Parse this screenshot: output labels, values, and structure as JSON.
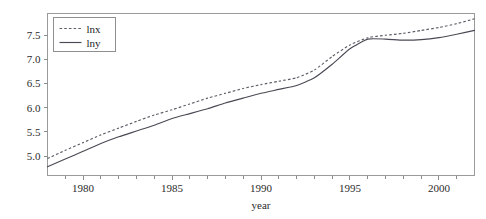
{
  "chart_data": {
    "type": "line",
    "title": "",
    "subtitle": "",
    "xlabel": "year",
    "ylabel": "",
    "xlim": [
      1978,
      2002
    ],
    "ylim": [
      4.6,
      7.95
    ],
    "grid": false,
    "legend_position": "top-left",
    "x_ticks_major": [
      "1980",
      "1985",
      "1990",
      "1995",
      "2000"
    ],
    "x_ticks_major_values": [
      1980,
      1985,
      1990,
      1995,
      2000
    ],
    "x_ticks_minor_values": [
      1979,
      1981,
      1982,
      1983,
      1984,
      1986,
      1987,
      1988,
      1989,
      1991,
      1992,
      1993,
      1994,
      1996,
      1997,
      1998,
      1999,
      2001
    ],
    "y_ticks": [
      "5.0",
      "5.5",
      "6.0",
      "6.5",
      "7.0",
      "7.5"
    ],
    "y_ticks_values": [
      5.0,
      5.5,
      6.0,
      6.5,
      7.0,
      7.5
    ],
    "x": [
      1978,
      1979,
      1980,
      1981,
      1982,
      1983,
      1984,
      1985,
      1986,
      1987,
      1988,
      1989,
      1990,
      1991,
      1992,
      1993,
      1994,
      1995,
      1996,
      1997,
      1998,
      1999,
      2000,
      2001,
      2002
    ],
    "series": [
      {
        "name": "lnx",
        "style": "dashed",
        "color": "#5d5d68",
        "values": [
          4.95,
          5.12,
          5.28,
          5.44,
          5.58,
          5.72,
          5.85,
          5.96,
          6.08,
          6.2,
          6.3,
          6.4,
          6.48,
          6.55,
          6.62,
          6.78,
          7.06,
          7.3,
          7.45,
          7.5,
          7.54,
          7.6,
          7.66,
          7.74,
          7.84
        ]
      },
      {
        "name": "lny",
        "style": "solid",
        "color": "#4a4a55",
        "values": [
          4.78,
          4.94,
          5.1,
          5.26,
          5.4,
          5.52,
          5.64,
          5.78,
          5.88,
          5.98,
          6.1,
          6.2,
          6.3,
          6.38,
          6.46,
          6.62,
          6.9,
          7.22,
          7.42,
          7.42,
          7.4,
          7.41,
          7.45,
          7.52,
          7.6
        ]
      }
    ],
    "legend": [
      {
        "label": "lnx",
        "style": "dashed"
      },
      {
        "label": "lny",
        "style": "solid"
      }
    ]
  },
  "axis": {
    "x_title": "year"
  }
}
